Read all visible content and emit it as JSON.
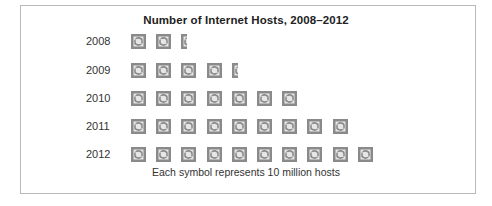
{
  "chart_data": {
    "type": "pictograph",
    "title": "Number of Internet Hosts, 2008–2012",
    "xlabel": "",
    "ylabel": "",
    "categories": [
      "2008",
      "2009",
      "2010",
      "2011",
      "2012"
    ],
    "symbols": [
      2.4,
      4.4,
      7,
      9,
      10
    ],
    "values": [
      24,
      44,
      70,
      90,
      100
    ],
    "unit": "million hosts",
    "symbol_value": 10,
    "symbol_icon": "globe-icon",
    "legend": "Each symbol represents 10 million hosts",
    "grid": false
  },
  "colors": {
    "symbol": "#8a8a8a",
    "frame": "#b9b9b9",
    "text": "#222222"
  }
}
